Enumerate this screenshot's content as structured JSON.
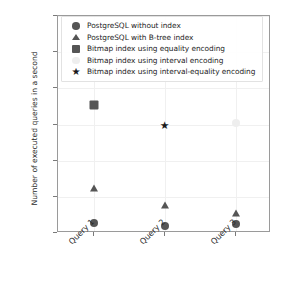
{
  "chart_data": {
    "type": "scatter",
    "title": "",
    "xlabel": "",
    "ylabel": "Number of executed queries in a second",
    "categories": [
      "Query 1",
      "Query 2",
      "Query 3"
    ],
    "x": [
      0,
      1,
      2
    ],
    "ylim": [
      0,
      600
    ],
    "yticks": [
      0,
      100,
      200,
      300,
      400,
      500,
      600
    ],
    "ytick_labels": [
      "0",
      "100",
      "200",
      "300",
      "400",
      "500",
      "600"
    ],
    "grid": true,
    "legend_position": "upper center",
    "series": [
      {
        "name": "PostgreSQL without index",
        "marker": "circle",
        "color": "#555555",
        "values": [
          27,
          18,
          25
        ]
      },
      {
        "name": "PostgreSQL with B-tree index",
        "marker": "triangle",
        "color": "#555555",
        "values": [
          125,
          78,
          56
        ]
      },
      {
        "name": "Bitmap index using equality encoding",
        "marker": "square",
        "color": "#555555",
        "values": [
          355,
          null,
          null
        ]
      },
      {
        "name": "Bitmap index using interval encoding",
        "marker": "circle",
        "color": "#eeeeee",
        "values": [
          null,
          null,
          305
        ]
      },
      {
        "name": "Bitmap index using interval-equality encoding",
        "marker": "star",
        "color": "#1a1a1a",
        "values": [
          null,
          292,
          null
        ]
      }
    ]
  },
  "legend": {
    "items": [
      {
        "label": "PostgreSQL without index",
        "marker": "circle",
        "color": "#555555"
      },
      {
        "label": "PostgreSQL with B-tree index",
        "marker": "triangle",
        "color": "#555555"
      },
      {
        "label": "Bitmap index using equality encoding",
        "marker": "square",
        "color": "#555555"
      },
      {
        "label": "Bitmap index using interval encoding",
        "marker": "circle",
        "color": "#eeeeee"
      },
      {
        "label": "Bitmap index using interval-equality encoding",
        "marker": "star",
        "color": "#1a1a1a"
      }
    ]
  }
}
